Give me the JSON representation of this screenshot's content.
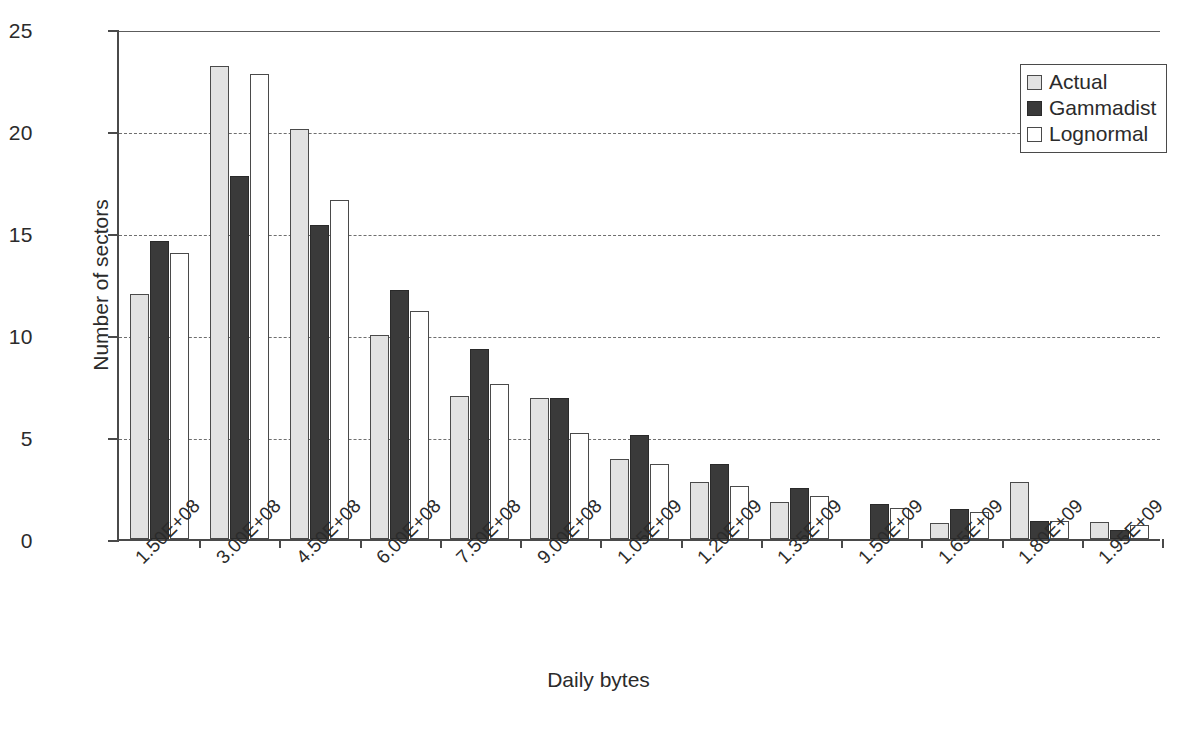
{
  "chart_data": {
    "type": "bar",
    "title": "",
    "xlabel": "Daily bytes",
    "ylabel": "Number of sectors",
    "ylim": [
      0,
      25
    ],
    "yticks": [
      0,
      5,
      10,
      15,
      20,
      25
    ],
    "grid": true,
    "legend_position": "top-right",
    "categories": [
      "1.50E+08",
      "3.00E+08",
      "4.50E+08",
      "6.00E+08",
      "7.50E+08",
      "9.00E+08",
      "1.05E+09",
      "1.20E+09",
      "1.35E+09",
      "1.50E+09",
      "1.65E+09",
      "1.80E+09",
      "1.95E+09"
    ],
    "series": [
      {
        "name": "Actual",
        "color": "#e2e2e2",
        "values": [
          12.0,
          23.2,
          20.1,
          10.0,
          7.0,
          6.9,
          3.9,
          2.8,
          1.8,
          0.0,
          0.8,
          2.8,
          0.85
        ]
      },
      {
        "name": "Gammadist",
        "color": "#3a3a3a",
        "values": [
          14.6,
          17.8,
          15.4,
          12.2,
          9.3,
          6.9,
          5.1,
          3.7,
          2.5,
          1.7,
          1.45,
          0.9,
          0.45
        ]
      },
      {
        "name": "Lognormal",
        "color": "#ffffff",
        "values": [
          14.0,
          22.8,
          16.6,
          11.2,
          7.6,
          5.2,
          3.7,
          2.6,
          2.1,
          1.5,
          1.3,
          0.9,
          0.7
        ]
      }
    ]
  },
  "legend": {
    "items": [
      {
        "label": "Actual"
      },
      {
        "label": "Gammadist"
      },
      {
        "label": "Lognormal"
      }
    ]
  },
  "caption": {
    "text": ""
  }
}
